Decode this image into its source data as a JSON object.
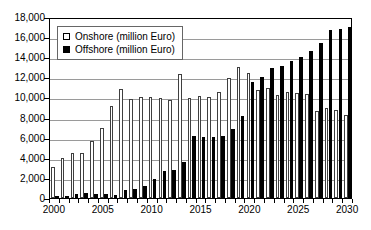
{
  "chart_data": {
    "type": "bar",
    "title": "",
    "subtitle": "",
    "xlabel": "",
    "ylabel": "",
    "ylim": [
      0,
      18000
    ],
    "ytick_step": 2000,
    "ytick_labels": [
      "0",
      "2,000",
      "4,000",
      "6,000",
      "8,000",
      "10,000",
      "12,000",
      "14,000",
      "16,000",
      "18,000"
    ],
    "ytick_values": [
      0,
      2000,
      4000,
      6000,
      8000,
      10000,
      12000,
      14000,
      16000,
      18000
    ],
    "grid": true,
    "grid_axis": "y",
    "legend_position": "upper-left-inside",
    "categories": [
      2000,
      2001,
      2002,
      2003,
      2004,
      2005,
      2006,
      2007,
      2008,
      2009,
      2010,
      2011,
      2012,
      2013,
      2014,
      2015,
      2016,
      2017,
      2018,
      2019,
      2020,
      2021,
      2022,
      2023,
      2024,
      2025,
      2026,
      2027,
      2028,
      2029,
      2030
    ],
    "xtick_labels": [
      "2000",
      "2005",
      "2010",
      "2015",
      "2020",
      "2025",
      "2030"
    ],
    "xtick_values": [
      2000,
      2005,
      2010,
      2015,
      2020,
      2025,
      2030
    ],
    "series": [
      {
        "name": "Onshore (million Euro)",
        "color": "#ffffff",
        "edge_color": "#3f3f3f",
        "swatch": "hollow-square",
        "values": [
          3050,
          3950,
          4500,
          4450,
          5700,
          7000,
          9200,
          10800,
          9800,
          10050,
          10000,
          9950,
          9750,
          12300,
          9900,
          10100,
          10050,
          10500,
          11900,
          13000,
          12400,
          10700,
          10900,
          10200,
          10500,
          10400,
          10300,
          8700,
          9000,
          8750,
          8300
        ]
      },
      {
        "name": "Offshore (million Euro)",
        "color": "#000000",
        "edge_color": "#000000",
        "swatch": "filled-square",
        "values": [
          150,
          250,
          400,
          500,
          350,
          350,
          300,
          800,
          850,
          1150,
          1900,
          2700,
          2800,
          3550,
          6200,
          6100,
          6050,
          6200,
          6900,
          8150,
          11500,
          12050,
          12900,
          13100,
          13600,
          14050,
          14600,
          15400,
          16700,
          16800,
          17000
        ]
      }
    ]
  }
}
